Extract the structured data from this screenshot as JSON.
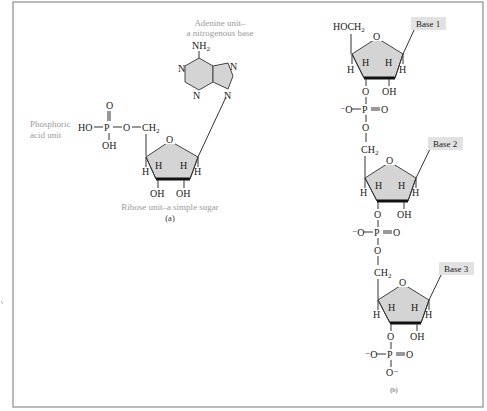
{
  "figure": {
    "panel_a": {
      "label": "(a)",
      "captions": {
        "adenine_line1": "Adenine unit–",
        "adenine_line2": "a nitrogenous base",
        "phosphoric_line1": "Phosphoric",
        "phosphoric_line2": "acid unit",
        "ribose": "Ribose unit–a simple sugar"
      },
      "atoms": {
        "nh2": "NH",
        "nh2_sub": "2",
        "n": "N",
        "o": "O",
        "ho": "HO",
        "p": "P",
        "oh": "OH",
        "ch2": "CH",
        "ch2_sub": "2",
        "h": "H",
        "dash": "—"
      }
    },
    "panel_b": {
      "label": "(b)",
      "top_group": "HOCH",
      "top_group_sub": "2",
      "bases": [
        "Base 1",
        "Base 2",
        "Base 3"
      ],
      "atoms": {
        "o": "O",
        "o_minus": "⁻O",
        "o_minus_bottom": "O⁻",
        "p": "P",
        "oh": "OH",
        "ch2": "CH",
        "ch2_sub": "2",
        "h": "H"
      }
    },
    "colors": {
      "ring_fill": "#d4d4d4",
      "base_label_fill": "#e2e2e2",
      "caption_text": "#9a9a9a",
      "frame": "#8c8c8c"
    }
  }
}
